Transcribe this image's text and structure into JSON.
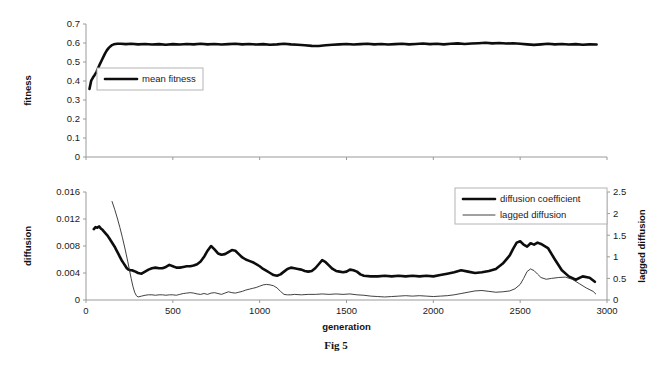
{
  "figure": {
    "caption": "Fig 5",
    "caption_top": 339
  },
  "chart_data": [
    {
      "type": "line",
      "id": "fitness-chart",
      "title": "",
      "xlabel": "",
      "ylabel": "fitness",
      "xlim": [
        0,
        3000
      ],
      "ylim": [
        0,
        0.7
      ],
      "grid": false,
      "x_tick_labels_visible": false,
      "xticks": [
        0,
        500,
        1000,
        1500,
        2000,
        2500,
        3000
      ],
      "xticklabels": [
        "",
        "",
        "",
        "",
        "",
        "",
        ""
      ],
      "yticks": [
        0,
        0.1,
        0.2,
        0.3,
        0.4,
        0.5,
        0.6,
        0.7
      ],
      "yticklabels": [
        "0",
        "0.1",
        "0.2",
        "0.3",
        "0.4",
        "0.5",
        "0.6",
        "0.7"
      ],
      "legend_position": "inside-left",
      "series": [
        {
          "name": "mean fitness",
          "style": "thick",
          "x": [
            20,
            30,
            40,
            50,
            60,
            70,
            80,
            90,
            100,
            110,
            120,
            130,
            140,
            150,
            160,
            180,
            200,
            230,
            260,
            300,
            340,
            380,
            420,
            460,
            500,
            540,
            580,
            620,
            660,
            700,
            740,
            780,
            820,
            860,
            900,
            940,
            980,
            1020,
            1060,
            1100,
            1140,
            1180,
            1220,
            1260,
            1300,
            1340,
            1380,
            1420,
            1460,
            1500,
            1540,
            1580,
            1620,
            1660,
            1700,
            1740,
            1780,
            1820,
            1860,
            1900,
            1940,
            1980,
            2020,
            2060,
            2100,
            2140,
            2180,
            2220,
            2260,
            2300,
            2340,
            2380,
            2420,
            2460,
            2500,
            2540,
            2580,
            2620,
            2660,
            2700,
            2740,
            2780,
            2820,
            2860,
            2900,
            2940
          ],
          "y": [
            0.358,
            0.402,
            0.418,
            0.432,
            0.447,
            0.468,
            0.489,
            0.508,
            0.527,
            0.545,
            0.561,
            0.573,
            0.582,
            0.589,
            0.593,
            0.596,
            0.596,
            0.594,
            0.596,
            0.593,
            0.595,
            0.592,
            0.594,
            0.591,
            0.594,
            0.592,
            0.595,
            0.593,
            0.596,
            0.593,
            0.595,
            0.592,
            0.594,
            0.596,
            0.593,
            0.595,
            0.592,
            0.594,
            0.591,
            0.593,
            0.596,
            0.593,
            0.591,
            0.588,
            0.585,
            0.584,
            0.588,
            0.591,
            0.593,
            0.595,
            0.592,
            0.594,
            0.596,
            0.593,
            0.595,
            0.592,
            0.594,
            0.596,
            0.593,
            0.595,
            0.597,
            0.594,
            0.596,
            0.593,
            0.596,
            0.598,
            0.595,
            0.597,
            0.599,
            0.601,
            0.598,
            0.6,
            0.597,
            0.599,
            0.596,
            0.593,
            0.59,
            0.593,
            0.596,
            0.593,
            0.595,
            0.592,
            0.594,
            0.591,
            0.593,
            0.592
          ]
        }
      ]
    },
    {
      "type": "line",
      "id": "diffusion-chart",
      "title": "",
      "xlabel": "generation",
      "ylabel": "diffusion",
      "y2label": "lagged diffusion",
      "xlim": [
        0,
        3000
      ],
      "ylim": [
        0,
        0.016
      ],
      "y2lim": [
        0,
        2.5
      ],
      "grid": false,
      "xticks": [
        0,
        500,
        1000,
        1500,
        2000,
        2500,
        3000
      ],
      "xticklabels": [
        "0",
        "500",
        "1000",
        "1500",
        "2000",
        "2500",
        "3000"
      ],
      "yticks": [
        0,
        0.004,
        0.008,
        0.012,
        0.016
      ],
      "yticklabels": [
        "0",
        "0.004",
        "0.008",
        "0.012",
        "0.016"
      ],
      "y2ticks": [
        0,
        0.5,
        1,
        1.5,
        2,
        2.5
      ],
      "y2ticklabels": [
        "0",
        "0.5",
        "1",
        "1.5",
        "2",
        "2.5"
      ],
      "legend_position": "top-right",
      "series": [
        {
          "name": "diffusion coefficient",
          "style": "thick",
          "axis": "left",
          "x": [
            45,
            55,
            65,
            75,
            85,
            95,
            105,
            115,
            125,
            135,
            145,
            155,
            165,
            175,
            185,
            195,
            205,
            215,
            225,
            235,
            245,
            255,
            265,
            275,
            285,
            300,
            320,
            340,
            360,
            380,
            400,
            420,
            440,
            460,
            480,
            500,
            520,
            540,
            560,
            580,
            600,
            620,
            640,
            660,
            680,
            700,
            720,
            740,
            760,
            780,
            800,
            820,
            840,
            860,
            880,
            900,
            920,
            940,
            960,
            980,
            1000,
            1020,
            1040,
            1060,
            1080,
            1100,
            1120,
            1140,
            1160,
            1180,
            1200,
            1220,
            1240,
            1260,
            1280,
            1300,
            1320,
            1340,
            1360,
            1380,
            1400,
            1420,
            1440,
            1460,
            1480,
            1500,
            1520,
            1540,
            1560,
            1580,
            1600,
            1640,
            1680,
            1720,
            1760,
            1800,
            1840,
            1880,
            1920,
            1960,
            2000,
            2040,
            2080,
            2120,
            2160,
            2200,
            2240,
            2280,
            2320,
            2360,
            2400,
            2440,
            2460,
            2480,
            2500,
            2520,
            2540,
            2560,
            2580,
            2600,
            2620,
            2660,
            2700,
            2740,
            2780,
            2820,
            2860,
            2900,
            2930
          ],
          "y": [
            0.0105,
            0.0108,
            0.0107,
            0.0109,
            0.0106,
            0.0104,
            0.0101,
            0.0098,
            0.0095,
            0.0091,
            0.0087,
            0.0083,
            0.0079,
            0.0074,
            0.0069,
            0.0064,
            0.0059,
            0.0055,
            0.0051,
            0.0047,
            0.0045,
            0.0044,
            0.0044,
            0.0043,
            0.0042,
            0.004,
            0.0039,
            0.0042,
            0.0045,
            0.0047,
            0.0048,
            0.0047,
            0.0047,
            0.0049,
            0.0052,
            0.005,
            0.0048,
            0.0048,
            0.0049,
            0.005,
            0.005,
            0.0051,
            0.0053,
            0.0057,
            0.0064,
            0.0073,
            0.008,
            0.0075,
            0.0069,
            0.0067,
            0.0068,
            0.0071,
            0.0074,
            0.0073,
            0.0068,
            0.0063,
            0.006,
            0.0058,
            0.0056,
            0.0053,
            0.005,
            0.0046,
            0.0043,
            0.004,
            0.0037,
            0.0036,
            0.0038,
            0.0042,
            0.0046,
            0.0048,
            0.0047,
            0.0046,
            0.0045,
            0.0043,
            0.0042,
            0.0043,
            0.0047,
            0.0053,
            0.0059,
            0.0056,
            0.0051,
            0.0046,
            0.0043,
            0.0042,
            0.0041,
            0.0042,
            0.0045,
            0.0044,
            0.0042,
            0.0038,
            0.0036,
            0.0035,
            0.0035,
            0.0036,
            0.0035,
            0.0036,
            0.0035,
            0.0036,
            0.0035,
            0.0036,
            0.0035,
            0.0037,
            0.0039,
            0.0041,
            0.0044,
            0.0042,
            0.004,
            0.0041,
            0.0043,
            0.0046,
            0.0054,
            0.0066,
            0.0076,
            0.0085,
            0.0087,
            0.0082,
            0.0079,
            0.0084,
            0.0082,
            0.0085,
            0.0083,
            0.0077,
            0.006,
            0.0044,
            0.0035,
            0.003,
            0.0035,
            0.0033,
            0.0027,
            0.003,
            0.0034
          ],
          "notes": "starts ~0.0105, drops to ~0.004 by gen 300, mid plateau 0.004-0.008, peak ~0.0087 near gen 2480"
        },
        {
          "name": "lagged diffusion",
          "style": "thin",
          "axis": "right",
          "x": [
            150,
            165,
            180,
            195,
            210,
            225,
            240,
            250,
            260,
            270,
            280,
            290,
            300,
            320,
            340,
            360,
            380,
            400,
            420,
            440,
            460,
            480,
            500,
            520,
            540,
            560,
            580,
            600,
            620,
            640,
            660,
            680,
            700,
            720,
            740,
            760,
            780,
            800,
            820,
            840,
            860,
            880,
            900,
            920,
            940,
            960,
            980,
            1000,
            1020,
            1040,
            1060,
            1080,
            1100,
            1120,
            1140,
            1160,
            1180,
            1200,
            1240,
            1280,
            1320,
            1360,
            1400,
            1440,
            1480,
            1520,
            1560,
            1600,
            1640,
            1680,
            1720,
            1760,
            1800,
            1840,
            1880,
            1920,
            1960,
            2000,
            2040,
            2080,
            2120,
            2160,
            2200,
            2240,
            2280,
            2320,
            2360,
            2400,
            2440,
            2470,
            2500,
            2520,
            2540,
            2560,
            2580,
            2600,
            2620,
            2650,
            2680,
            2720,
            2760,
            2800,
            2840,
            2880,
            2920,
            2935
          ],
          "y": [
            2.28,
            2.1,
            1.9,
            1.68,
            1.44,
            1.18,
            0.9,
            0.7,
            0.5,
            0.32,
            0.18,
            0.1,
            0.07,
            0.09,
            0.11,
            0.12,
            0.12,
            0.11,
            0.12,
            0.12,
            0.11,
            0.12,
            0.12,
            0.11,
            0.13,
            0.15,
            0.16,
            0.17,
            0.16,
            0.14,
            0.13,
            0.15,
            0.13,
            0.16,
            0.17,
            0.15,
            0.13,
            0.16,
            0.19,
            0.17,
            0.16,
            0.18,
            0.2,
            0.23,
            0.25,
            0.27,
            0.29,
            0.32,
            0.35,
            0.36,
            0.35,
            0.33,
            0.28,
            0.2,
            0.13,
            0.12,
            0.12,
            0.13,
            0.12,
            0.13,
            0.13,
            0.14,
            0.13,
            0.14,
            0.13,
            0.14,
            0.12,
            0.11,
            0.09,
            0.08,
            0.07,
            0.08,
            0.09,
            0.1,
            0.09,
            0.1,
            0.09,
            0.08,
            0.09,
            0.1,
            0.12,
            0.15,
            0.18,
            0.21,
            0.22,
            0.2,
            0.18,
            0.19,
            0.21,
            0.26,
            0.36,
            0.5,
            0.66,
            0.72,
            0.68,
            0.6,
            0.52,
            0.48,
            0.5,
            0.52,
            0.53,
            0.48,
            0.38,
            0.28,
            0.2,
            0.14,
            0.12,
            0.15
          ],
          "notes": "starts ~2.3 at gen 150, collapses to ~0.1 by gen 290, small bump ~0.36 near gen 1040, peak ~0.72 near gen 2520"
        }
      ]
    }
  ]
}
